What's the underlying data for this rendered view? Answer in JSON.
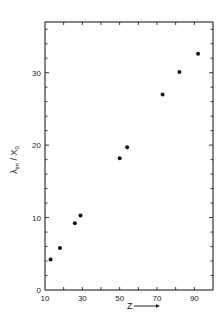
{
  "chart_data": {
    "type": "scatter",
    "title": "",
    "xlabel": "Z",
    "ylabel": "λ_int / X_0",
    "ylabel_parts": {
      "main": "λ",
      "sub": "int",
      "sep": " / ",
      "main2": "X",
      "sub2": "0"
    },
    "xlim": [
      10,
      100
    ],
    "ylim": [
      0,
      37
    ],
    "xticks": [
      10,
      30,
      50,
      70,
      90
    ],
    "xtick_labels": [
      "10",
      "30",
      "50",
      "70",
      "90"
    ],
    "xminor_ticks": [
      20,
      40,
      60,
      80
    ],
    "yticks": [
      0,
      10,
      20,
      30
    ],
    "ytick_labels": [
      "0",
      "10",
      "20",
      "30"
    ],
    "yminor_step": 2,
    "grid": false,
    "legend": null,
    "series": [
      {
        "name": "data",
        "marker": "filled-circle",
        "x": [
          13,
          18,
          26,
          29,
          50,
          54,
          73,
          82,
          92
        ],
        "y": [
          4.2,
          5.8,
          9.2,
          10.3,
          18.2,
          19.7,
          27.0,
          30.1,
          32.6
        ]
      }
    ]
  }
}
